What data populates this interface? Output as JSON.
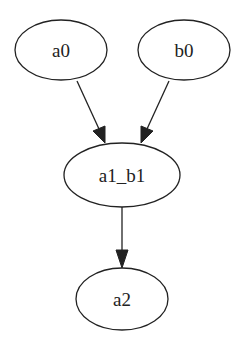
{
  "graph": {
    "type": "directed",
    "nodes": [
      {
        "id": "a0",
        "label": "a0"
      },
      {
        "id": "b0",
        "label": "b0"
      },
      {
        "id": "a1_b1",
        "label": "a1_b1"
      },
      {
        "id": "a2",
        "label": "a2"
      }
    ],
    "edges": [
      {
        "from": "a0",
        "to": "a1_b1"
      },
      {
        "from": "b0",
        "to": "a1_b1"
      },
      {
        "from": "a1_b1",
        "to": "a2"
      }
    ]
  }
}
